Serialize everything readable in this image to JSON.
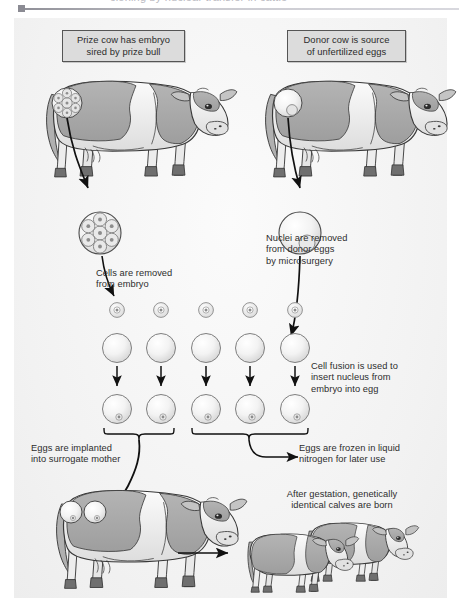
{
  "figure": {
    "title_clipped": "cloning by nuclear transfer in cattle",
    "background_color": "#f4f4f4",
    "ink_color": "#2d2d2d"
  },
  "captions": {
    "prize_cow": "Prize cow has embryo\nsired by prize bull",
    "donor_cow": "Donor cow is source\nof unfertilized eggs"
  },
  "annotations": {
    "nuclei_removed": "Nuclei are removed\nfrom donor eggs\nby microsurgery",
    "cells_removed": "Cells are removed\nfrom embryo",
    "cell_fusion": "Cell fusion is used to\ninsert nucleus from\nembryo into egg",
    "eggs_implanted": "Eggs are implanted\ninto surrogate mother",
    "eggs_frozen": "Eggs are frozen in liquid\nnitrogen for later use",
    "after_gestation": "After gestation, genetically\nidentical calves are born"
  },
  "counts": {
    "embryo_cells": 7,
    "extracted_cells": 5,
    "enucleated_eggs": 5,
    "fused_eggs": 5,
    "implanted_eggs": 2,
    "frozen_eggs": 3,
    "surrogate_embryos": 2,
    "calves": 2
  },
  "colors": {
    "hide_gray": "#a9a9a9",
    "hide_light": "#d8d8d8",
    "hide_white": "#f2f2f2",
    "hoof": "#6f6f6f",
    "outline": "#333333",
    "caption_fill": "#dcdcdc",
    "caption_border": "#555555",
    "egg_edge": "#9a9a9a"
  }
}
